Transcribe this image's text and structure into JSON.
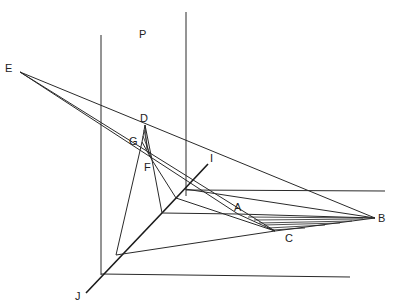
{
  "diagram": {
    "labels": {
      "E": "E",
      "P": "P",
      "D": "D",
      "G": "G",
      "F": "F",
      "I": "I",
      "A": "A",
      "B": "B",
      "C": "C",
      "J": "J"
    },
    "points": {
      "E": [
        20,
        72
      ],
      "D": [
        145,
        125
      ],
      "G": [
        142,
        142
      ],
      "F": [
        152,
        160
      ],
      "O": [
        162,
        213
      ],
      "A": [
        238,
        214
      ],
      "B": [
        375,
        218
      ],
      "C": [
        275,
        231
      ],
      "I_end": [
        208,
        164
      ],
      "J_end": [
        86,
        293
      ]
    },
    "colors": {
      "line": "#2a2a2a",
      "background": "#ffffff"
    }
  }
}
